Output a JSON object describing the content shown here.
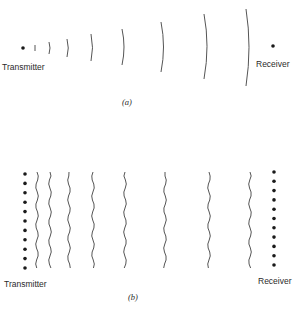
{
  "panels": [
    {
      "id": "a",
      "caption": "(a)",
      "transmitter_label": "Transmitter",
      "receiver_label": "Receiver",
      "transmitter": {
        "type": "point-source",
        "dots": 1
      },
      "receiver": {
        "type": "point",
        "dots": 1
      },
      "wavefronts": {
        "type": "spherical-arcs",
        "count": 8
      }
    },
    {
      "id": "b",
      "caption": "(b)",
      "transmitter_label": "Transmitter",
      "receiver_label": "Receiver",
      "transmitter": {
        "type": "line-array",
        "dots": 11
      },
      "receiver": {
        "type": "line-array",
        "dots": 11
      },
      "wavefronts": {
        "type": "plane-wavy-lines",
        "count": 8
      }
    }
  ],
  "colors": {
    "ink": "#1a1a1a",
    "wave": "#555555",
    "background": "#ffffff"
  }
}
